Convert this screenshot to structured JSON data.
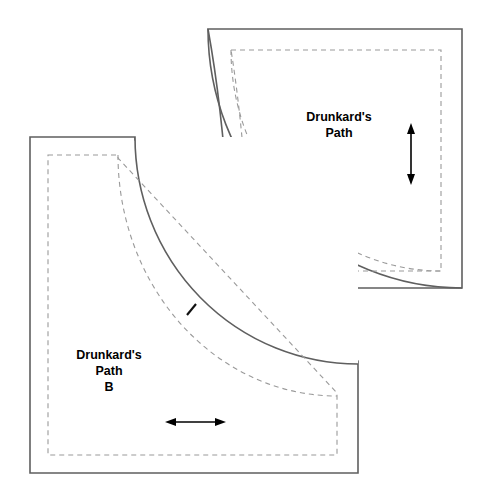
{
  "diagram": {
    "background_color": "#ffffff",
    "cut_line_color": "#5f5f5f",
    "seam_line_color": "#9a9a9a",
    "mark_color": "#000000",
    "pieces": [
      {
        "id": "A",
        "name_line_1": "Drunkard's",
        "name_line_2": "Path",
        "name_line_3": "A",
        "shape": "quarter-circle-convex",
        "grain_arrow_direction": "vertical",
        "label_center": {
          "x": 339,
          "y": 130
        },
        "cut_path": "M 208 29 L 462 29 L 462 288 L 232 288 C 232 288 230 150 208 29 Z",
        "seam_path": "M 231 50 L 441 50 L 441 271 L 250 271 C 250 271 248 155 231 50 Z",
        "arc_cut": "M 208 29 A 254 259 0 0 0 462 288",
        "arc_seam": "M 231 50 A 210 221 0 0 0 441 271",
        "notch": {
          "x1": 272,
          "y1": 221,
          "x2": 281,
          "y2": 210
        },
        "arrow": {
          "x": 411,
          "y1": 126,
          "y2": 182
        }
      },
      {
        "id": "B",
        "name_line_1": "Drunkard's",
        "name_line_2": "Path",
        "name_line_3": "B",
        "shape": "quarter-circle-concave",
        "grain_arrow_direction": "horizontal",
        "label_center": {
          "x": 109,
          "y": 368
        },
        "cut_path": "M 30 137 L 135 137 C 135 137 138 300 358 364 L 358 473 L 30 473 Z",
        "seam_path": "M 48 155 L 118 155 C 118 155 121 312 337 396 L 337 455 L 48 455 Z",
        "arc_cut": "M 135 137 A 223 227 0 0 0 358 364",
        "arc_seam": "M 118 155 A 219 241 0 0 0 337 396",
        "notch": {
          "x1": 187,
          "y1": 315,
          "x2": 196,
          "y2": 304
        },
        "arrow": {
          "y": 422,
          "x1": 167,
          "x2": 224
        }
      }
    ]
  }
}
